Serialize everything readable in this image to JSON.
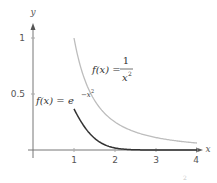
{
  "chart_data": {
    "type": "line",
    "title": "",
    "xlabel": "x",
    "ylabel": "y",
    "xlim": [
      0,
      4.1
    ],
    "ylim": [
      0,
      1.1
    ],
    "grid": false,
    "legend": "none (inline annotations)",
    "x_ticks": [
      "1",
      "2",
      "3",
      "4"
    ],
    "y_ticks": [
      "0.5",
      "1"
    ],
    "series": [
      {
        "name": "f(x) = 1/x^2",
        "color": "#bdbdbd",
        "domain": [
          1,
          4
        ],
        "x": [
          1,
          1.25,
          1.5,
          1.75,
          2,
          2.5,
          3,
          3.5,
          4
        ],
        "values": [
          1.0,
          0.64,
          0.444,
          0.327,
          0.25,
          0.16,
          0.111,
          0.082,
          0.0625
        ]
      },
      {
        "name": "f(x) = e^(-x^2)",
        "color": "#333333",
        "domain": [
          1,
          4
        ],
        "x": [
          1,
          1.25,
          1.5,
          1.75,
          2,
          2.5,
          3,
          3.5,
          4
        ],
        "values": [
          0.368,
          0.21,
          0.105,
          0.047,
          0.018,
          0.002,
          0.0001,
          0.0,
          0.0
        ]
      }
    ],
    "annotations": [
      {
        "text": "f(x) = 1/x²",
        "near": "upper curve, x≈1.5"
      },
      {
        "text": "f(x) = e^(−x²)",
        "near": "lower curve, x≈0.1, y≈0.45"
      }
    ]
  },
  "labels": {
    "x_axis": "x",
    "y_axis": "y",
    "tick_x1": "1",
    "tick_x2": "2",
    "tick_x3": "3",
    "tick_x4": "4",
    "tick_y05": "0.5",
    "tick_y1": "1",
    "fn1_lhs": "f(x) =",
    "fn1_num": "1",
    "fn1_den": "x",
    "fn1_den_exp": "2",
    "fn2_lhs": "f(x) = e",
    "fn2_exp": "−x",
    "fn2_exp2": "2",
    "faint_fragment": "2"
  },
  "colors": {
    "axis": "#777777",
    "curve_reciprocal": "#bdbdbd",
    "curve_gaussian": "#333333"
  }
}
